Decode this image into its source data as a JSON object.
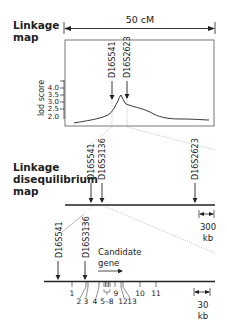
{
  "linkage_map": {
    "label_line1": "Linkage",
    "label_line2": "map",
    "scale_label": "50 cM",
    "y_axis_label": "lod score",
    "y_ticks": [
      "4.0",
      "3.5",
      "3.0",
      "2.5",
      "2.0"
    ],
    "markers": [
      "D16S541",
      "D16S2623"
    ]
  },
  "ld_map": {
    "label_line1": "Linkage",
    "label_line2": "disequilibrium",
    "label_line3": "map",
    "markers": [
      "D16S541",
      "D16S3136",
      "D16S2623"
    ],
    "scale_value": "300",
    "scale_unit": "kb"
  },
  "gene_map": {
    "markers": [
      "D16S541",
      "D16S3136"
    ],
    "gene_label_line1": "Candidate",
    "gene_label_line2": "gene",
    "exon_labels_row1": [
      "1",
      "9",
      "10",
      "11"
    ],
    "exon_labels_row2": [
      "2",
      "3",
      "4",
      "5–8",
      "12",
      "13"
    ],
    "scale_value": "30",
    "scale_unit": "kb"
  },
  "colors": {
    "line": "#222222",
    "dotted": "#999999",
    "frame": "#555555"
  }
}
